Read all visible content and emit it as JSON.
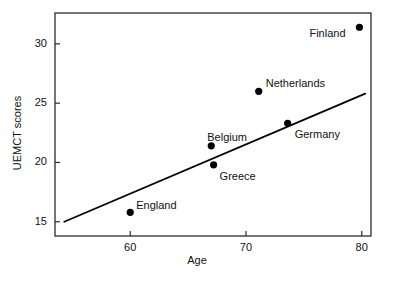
{
  "chart_data": {
    "type": "scatter",
    "title": "",
    "xlabel": "Age",
    "ylabel": "UEMCT scores",
    "xlim": [
      53.5,
      80.8
    ],
    "ylim": [
      13.8,
      32.6
    ],
    "xticks": [
      60,
      70,
      80
    ],
    "yticks": [
      15,
      20,
      25,
      30
    ],
    "xtick_labels": [
      "60",
      "70",
      "80"
    ],
    "ytick_labels": [
      "15",
      "20",
      "25",
      "30"
    ],
    "grid": false,
    "legend": "none",
    "frame": "box",
    "marker": "filled-circle",
    "marker_color": "#000000",
    "points": [
      {
        "label": "England",
        "x": 60.0,
        "y": 15.8,
        "label_dx": 6,
        "label_dy": -12
      },
      {
        "label": "Belgium",
        "x": 67.0,
        "y": 21.4,
        "label_dx": -4,
        "label_dy": -14
      },
      {
        "label": "Greece",
        "x": 67.2,
        "y": 19.8,
        "label_dx": 6,
        "label_dy": 6
      },
      {
        "label": "Netherlands",
        "x": 71.1,
        "y": 26.0,
        "label_dx": 7,
        "label_dy": -13
      },
      {
        "label": "Germany",
        "x": 73.6,
        "y": 23.3,
        "label_dx": 7,
        "label_dy": 6
      },
      {
        "label": "Finland",
        "x": 79.8,
        "y": 31.4,
        "label_dx": -50,
        "label_dy": 1
      }
    ],
    "trendline": {
      "type": "line",
      "color": "#000000",
      "x0": 54.3,
      "y0": 15.0,
      "x1": 80.3,
      "y1": 25.8
    }
  },
  "axes": {
    "x_title": "Age",
    "y_title": "UEMCT scores"
  }
}
